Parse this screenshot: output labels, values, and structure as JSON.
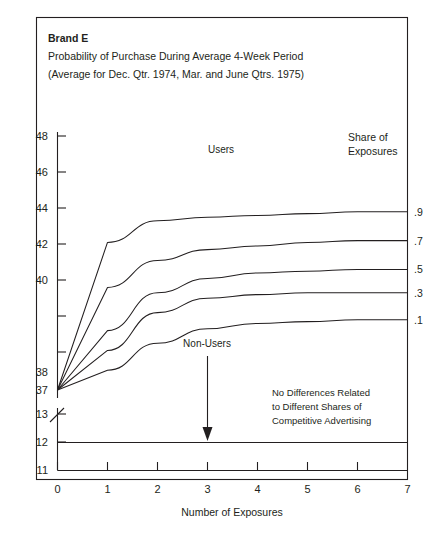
{
  "figure": {
    "brand": "Brand E",
    "subtitle_line1": "Probability of Purchase During Average 4-Week Period",
    "subtitle_line2": "(Average for Dec. Qtr. 1974, Mar. and June Qtrs. 1975)",
    "users_label": "Users",
    "share_label_line1": "Share of",
    "share_label_line2": "Exposures",
    "nonusers_label": "Non-Users",
    "note_line1": "No Differences Related",
    "note_line2": "to Different Shares of",
    "note_line3": "Competitive Advertising",
    "frame_color": "#231f20",
    "line_color": "#231f20"
  },
  "chart_data": {
    "type": "line",
    "subtitle": "(Average for Dec. Qtr. 1974, Mar. and June Qtrs. 1975)",
    "xlabel": "Number of Exposures",
    "ylabel": "",
    "x": [
      0,
      1,
      2,
      3,
      4,
      5,
      6,
      7
    ],
    "xlim": [
      0,
      7
    ],
    "xticks": [
      0,
      1,
      2,
      3,
      4,
      5,
      6,
      7
    ],
    "xticklabels": [
      "0",
      "1",
      "2",
      "3",
      "4",
      "5",
      "6",
      "7"
    ],
    "ylim_upper": [
      37,
      48
    ],
    "yticks_upper": [
      37,
      38,
      40,
      42,
      44,
      46,
      48
    ],
    "yticklabels_upper": [
      "37",
      "38",
      "40",
      "42",
      "44",
      "46",
      "48"
    ],
    "ylim_lower": [
      11,
      13
    ],
    "yticks_lower": [
      11,
      12,
      13
    ],
    "yticklabels_lower": [
      "11",
      "12",
      "13"
    ],
    "axis_break": true,
    "grid": false,
    "legend_position": "right",
    "legend_title": "Share of Exposures",
    "group_label_upper": "Users",
    "group_label_lower": "Non-Users",
    "series": [
      {
        "name": ".9",
        "values": [
          37.0,
          45.2,
          46.4,
          46.6,
          46.7,
          46.8,
          46.9,
          46.9
        ]
      },
      {
        "name": ".7",
        "values": [
          37.0,
          42.7,
          44.2,
          44.8,
          45.0,
          45.2,
          45.3,
          45.3
        ]
      },
      {
        "name": ".5",
        "values": [
          37.0,
          40.3,
          42.4,
          43.2,
          43.5,
          43.6,
          43.7,
          43.7
        ]
      },
      {
        "name": ".3",
        "values": [
          37.0,
          39.2,
          41.3,
          42.1,
          42.3,
          42.4,
          42.4,
          42.4
        ]
      },
      {
        "name": ".1",
        "values": [
          37.0,
          38.1,
          39.6,
          40.4,
          40.7,
          40.8,
          40.9,
          40.9
        ]
      }
    ],
    "nonusers_series": {
      "name": "Non-Users",
      "values": [
        12.0,
        12.0,
        12.0,
        12.0,
        12.0,
        12.0,
        12.0,
        12.0
      ]
    },
    "annotations": [
      {
        "text": "No Differences Related to Different Shares of Competitive Advertising",
        "x": 4.6,
        "y": 12.6
      },
      {
        "text": "Non-Users",
        "x": 3.5,
        "y": 12.9
      }
    ]
  }
}
